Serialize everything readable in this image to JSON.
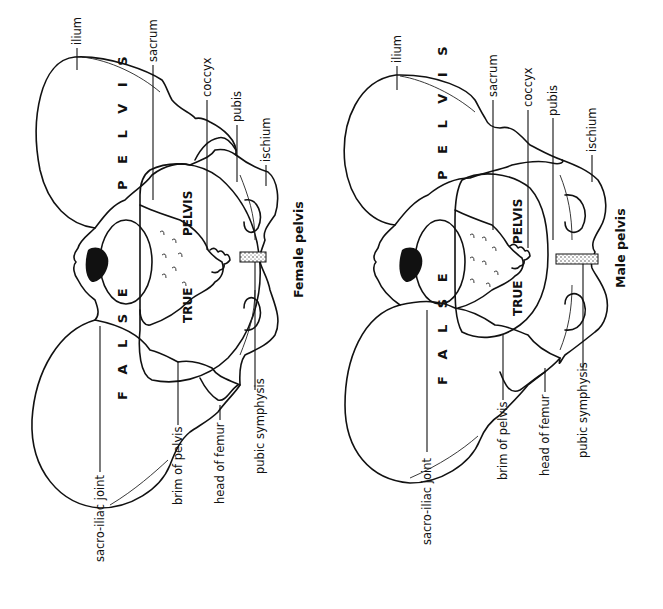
{
  "figure": {
    "orientation": "rotated 90° counter-clockwise",
    "panels": [
      {
        "caption": "Female pelvis",
        "regions": {
          "false_word": "F A L S E",
          "pelvis_top": "P E L V I S",
          "true_word": "TRUE",
          "pelvis_inner": "PELVIS"
        },
        "labels_top": [
          "ilium",
          "sacrum",
          "coccyx",
          "pubis",
          "ischium"
        ],
        "labels_bottom": [
          "sacro-iliac joint",
          "brim of pelvis",
          "head of femur",
          "pubic symphysis"
        ]
      },
      {
        "caption": "Male pelvis",
        "regions": {
          "false_word": "F A L S E",
          "pelvis_top": "P E L V I S",
          "true_word": "TRUE",
          "pelvis_inner": "PELVIS"
        },
        "labels_top": [
          "ilium",
          "sacrum",
          "coccyx",
          "pubis",
          "ischium"
        ],
        "labels_bottom": [
          "sacro-iliac joint",
          "brim of pelvis",
          "head of femur",
          "pubic symphysis"
        ]
      }
    ]
  }
}
